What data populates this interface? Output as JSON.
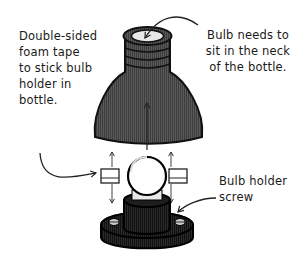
{
  "diagram": {
    "labels": {
      "tape": [
        "Double-sided",
        "foam tape",
        "to stick bulb",
        "holder in",
        "bottle."
      ],
      "neck": [
        "Bulb needs to",
        "sit in the neck",
        "of the bottle."
      ],
      "screw": [
        "Bulb holder",
        "screw"
      ]
    },
    "components": [
      "bottle-top",
      "bulb",
      "bulb-holder",
      "foam-tape-left",
      "foam-tape-right"
    ],
    "colors": {
      "bottle": "#4a4a4a",
      "holder": "#1e1e1e",
      "line": "#222222",
      "tape": "#ffffff",
      "bulb": "#ffffff"
    }
  }
}
